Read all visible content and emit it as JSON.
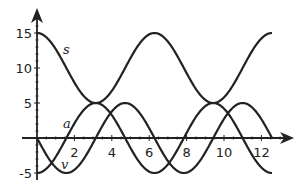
{
  "chart_data": {
    "type": "line",
    "title": "",
    "xlabel": "",
    "ylabel": "",
    "xlim": [
      0,
      13.5
    ],
    "ylim": [
      -5.5,
      17
    ],
    "grid": false,
    "x_ticks": [
      2,
      4,
      6,
      8,
      10,
      12
    ],
    "y_ticks": [
      -5,
      5,
      10,
      15
    ],
    "x_tick_labels": [
      "2",
      "4",
      "6",
      "8",
      "10",
      "12"
    ],
    "y_tick_labels": [
      "-5",
      "5",
      "10",
      "15"
    ],
    "x_domain": [
      0,
      12.566
    ],
    "series": [
      {
        "name": "s",
        "formula": "10 + 5*cos(t)",
        "label_pos": [
          1.6,
          12.5
        ],
        "x": [
          0,
          1.571,
          3.142,
          4.712,
          6.283,
          7.854,
          9.425,
          10.996,
          12.566
        ],
        "values": [
          15,
          10,
          5,
          10,
          15,
          10,
          5,
          10,
          15
        ]
      },
      {
        "name": "v",
        "formula": "-5*sin(t)",
        "label_pos": [
          1.5,
          -4.1
        ],
        "x": [
          0,
          1.571,
          3.142,
          4.712,
          6.283,
          7.854,
          9.425,
          10.996,
          12.566
        ],
        "values": [
          0,
          -5,
          0,
          5,
          0,
          -5,
          0,
          5,
          0
        ]
      },
      {
        "name": "a",
        "formula": "-5*cos(t)",
        "label_pos": [
          1.6,
          1.9
        ],
        "x": [
          0,
          1.571,
          3.142,
          4.712,
          6.283,
          7.854,
          9.425,
          10.996,
          12.566
        ],
        "values": [
          -5,
          0,
          5,
          0,
          -5,
          0,
          5,
          0,
          -5
        ]
      }
    ]
  },
  "labels": {
    "s": "s",
    "v": "v",
    "a": "a"
  }
}
